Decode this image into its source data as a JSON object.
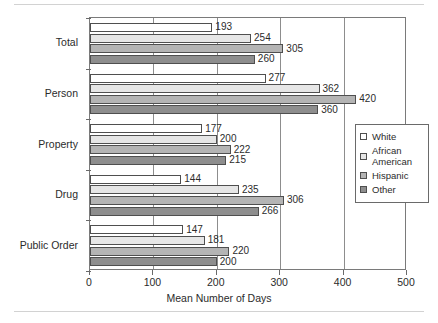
{
  "chart_data": {
    "type": "bar",
    "orientation": "horizontal",
    "title": "",
    "xlabel": "Mean Number of Days",
    "ylabel": "",
    "xlim": [
      0,
      500
    ],
    "xticks": [
      0,
      100,
      200,
      300,
      400,
      500
    ],
    "grid": true,
    "legend_position": "right",
    "categories": [
      "Total",
      "Person",
      "Property",
      "Drug",
      "Public Order"
    ],
    "series": [
      {
        "name": "White",
        "color": "#ffffff",
        "values": [
          193,
          277,
          177,
          144,
          147
        ]
      },
      {
        "name": "African American",
        "color": "#e6e6e6",
        "values": [
          254,
          362,
          200,
          235,
          181
        ]
      },
      {
        "name": "Hispanic",
        "color": "#b4b4b4",
        "values": [
          305,
          420,
          222,
          306,
          220
        ]
      },
      {
        "name": "Other",
        "color": "#8e8e8e",
        "values": [
          260,
          360,
          215,
          266,
          200
        ]
      }
    ]
  },
  "legend": {
    "entries": [
      {
        "label": "White"
      },
      {
        "label": "African\nAmerican"
      },
      {
        "label": "Hispanic"
      },
      {
        "label": "Other"
      }
    ]
  }
}
